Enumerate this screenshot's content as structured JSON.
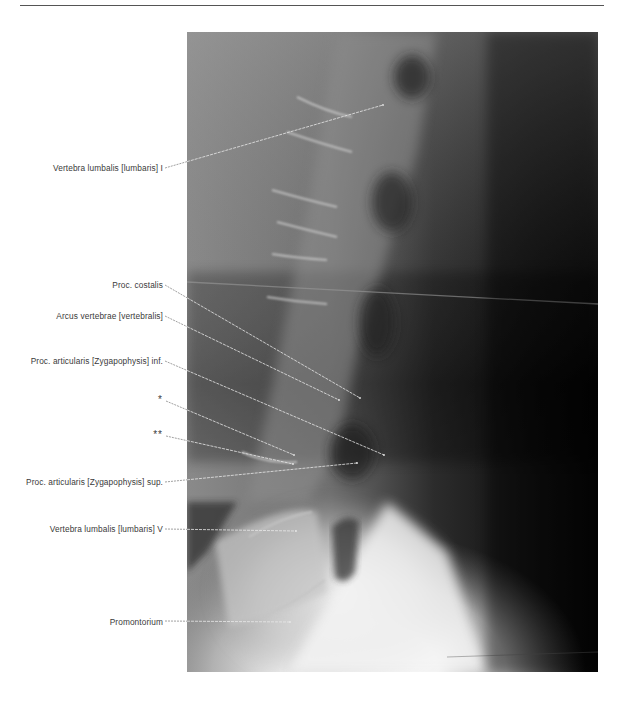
{
  "figure": {
    "colors": {
      "paper": "#ffffff",
      "label_text": "#3a3a3a",
      "leader_outside": "#777777",
      "leader_inside": "#e8e8e8"
    }
  },
  "labels": [
    {
      "id": "l1",
      "text": "Vertebra lumbalis  [lumbaris] I",
      "right": 163,
      "top": 163,
      "line": {
        "x1": 165,
        "y1": 168,
        "x2": 383,
        "y2": 105
      }
    },
    {
      "id": "costalis",
      "text": "Proc. costalis",
      "right": 163,
      "top": 280,
      "line": {
        "x1": 165,
        "y1": 285,
        "x2": 360,
        "y2": 398
      }
    },
    {
      "id": "arcus",
      "text": "Arcus vertebrae  [vertebralis]",
      "right": 163,
      "top": 311,
      "line": {
        "x1": 165,
        "y1": 316,
        "x2": 339,
        "y2": 400
      }
    },
    {
      "id": "art-inf",
      "text": "Proc. articularis  [Zygapophysis] inf.",
      "right": 163,
      "top": 356,
      "line": {
        "x1": 165,
        "y1": 361,
        "x2": 384,
        "y2": 455
      }
    },
    {
      "id": "star1",
      "text": "*",
      "right": 163,
      "top": 395,
      "line": {
        "x1": 166,
        "y1": 401,
        "x2": 294,
        "y2": 455
      },
      "star": true
    },
    {
      "id": "star2",
      "text": "**",
      "right": 163,
      "top": 430,
      "line": {
        "x1": 166,
        "y1": 436,
        "x2": 293,
        "y2": 464
      },
      "star": true
    },
    {
      "id": "art-sup",
      "text": "Proc. articularis  [Zygapophysis] sup.",
      "right": 163,
      "top": 477,
      "line": {
        "x1": 165,
        "y1": 482,
        "x2": 357,
        "y2": 463
      }
    },
    {
      "id": "l5",
      "text": "Vertebra lumbalis  [lumbaris] V",
      "right": 163,
      "top": 524,
      "line": {
        "x1": 165,
        "y1": 529,
        "x2": 296,
        "y2": 531
      }
    },
    {
      "id": "promontorium",
      "text": "Promontorium",
      "right": 163,
      "top": 617,
      "line": {
        "x1": 165,
        "y1": 621,
        "x2": 290,
        "y2": 622
      }
    }
  ]
}
